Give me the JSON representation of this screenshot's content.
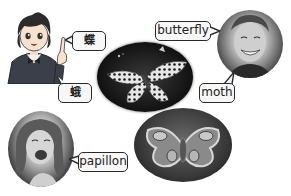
{
  "figure": {
    "labels": {
      "chinese_butterfly": "蝶",
      "chinese_moth": "蛾",
      "english_butterfly": "butterfly",
      "english_moth": "moth",
      "french_papillon": "papillon"
    },
    "images": {
      "cartoon_student": "cartoon-student",
      "butterfly_photo": "butterfly-photo",
      "moth_photo": "moth-photo",
      "man_portrait": "man-portrait",
      "girl_portrait": "girl-portrait"
    },
    "colors": {
      "bubble_fill": "#f7f7f7",
      "bubble_border": "#2a2a2a",
      "background": "#ffffff"
    }
  }
}
